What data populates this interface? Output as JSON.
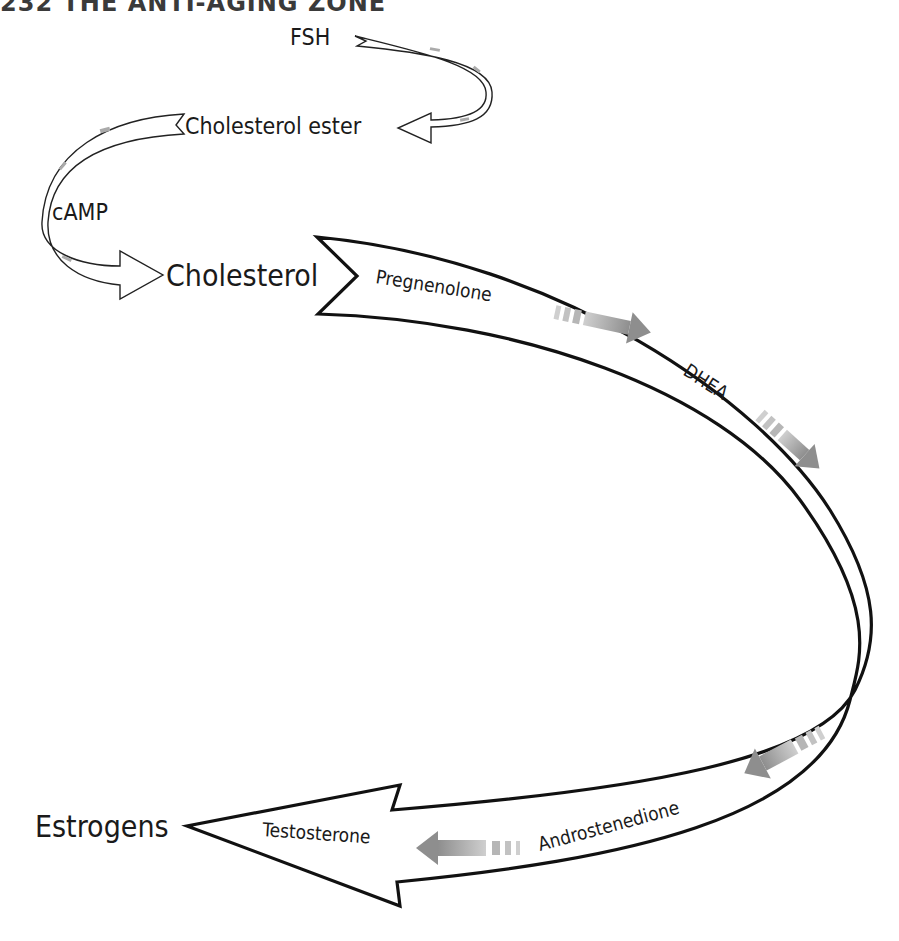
{
  "header": {
    "page_number": "232",
    "book_title": "THE ANTI-AGING ZONE",
    "text": "232   THE ANTI-AGING ZONE"
  },
  "diagram": {
    "labels": {
      "fsh": "FSH",
      "cholesterol_ester": "Cholesterol ester",
      "camp": "cAMP",
      "cholesterol": "Cholesterol",
      "pregnenolone": "Pregnenolone",
      "dhea": "DHEA",
      "androstenedione": "Androstenedione",
      "testosterone": "Testosterone",
      "estrogens": "Estrogens"
    },
    "flow": [
      "FSH",
      "Cholesterol ester",
      "cAMP",
      "Cholesterol",
      "Pregnenolone",
      "DHEA",
      "Androstenedione",
      "Testosterone",
      "Estrogens"
    ],
    "colors": {
      "outline": "#111111",
      "arrow_fill": "#ffffff",
      "flow_indicator": "#9a9a9a",
      "text": "#1a1a1a"
    }
  }
}
